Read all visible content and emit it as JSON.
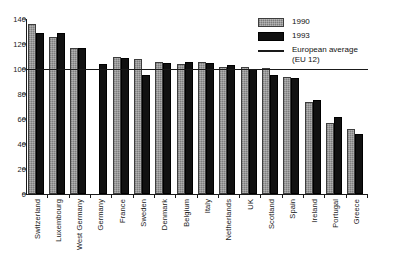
{
  "chart_data": {
    "type": "bar",
    "title": "",
    "xlabel": "",
    "ylabel": "",
    "ylim": [
      0,
      140
    ],
    "yticks": [
      0,
      20,
      40,
      60,
      80,
      100,
      120,
      140
    ],
    "grid": false,
    "legend_position": "top-right",
    "categories": [
      "Switzerland",
      "Luxembourg",
      "West Germany",
      "Germany",
      "France",
      "Sweden",
      "Denmark",
      "Belgium",
      "Italy",
      "Netherlands",
      "UK",
      "Scotland",
      "Spain",
      "Ireland",
      "Portugal",
      "Greece"
    ],
    "series": [
      {
        "name": "1990",
        "color": "#8f8f8f",
        "values": [
          136,
          126,
          117,
          null,
          110,
          108,
          106,
          104,
          106,
          102,
          102,
          101,
          94,
          74,
          57,
          52
        ]
      },
      {
        "name": "1993",
        "color": "#111111",
        "values": [
          129,
          129,
          117,
          104,
          109,
          95,
          105,
          106,
          105,
          103,
          100,
          95,
          93,
          75,
          62,
          48
        ]
      }
    ],
    "reference_line": {
      "label": "European average\n(EU 12)",
      "value": 100,
      "color": "#1a1a1a"
    }
  },
  "legend": {
    "items": [
      {
        "label": "1990",
        "swatch": "gray-hatch-swatch"
      },
      {
        "label": "1993",
        "swatch": "black-swatch"
      },
      {
        "label": "European average\n(EU 12)",
        "swatch": "reference-line-swatch"
      }
    ]
  }
}
